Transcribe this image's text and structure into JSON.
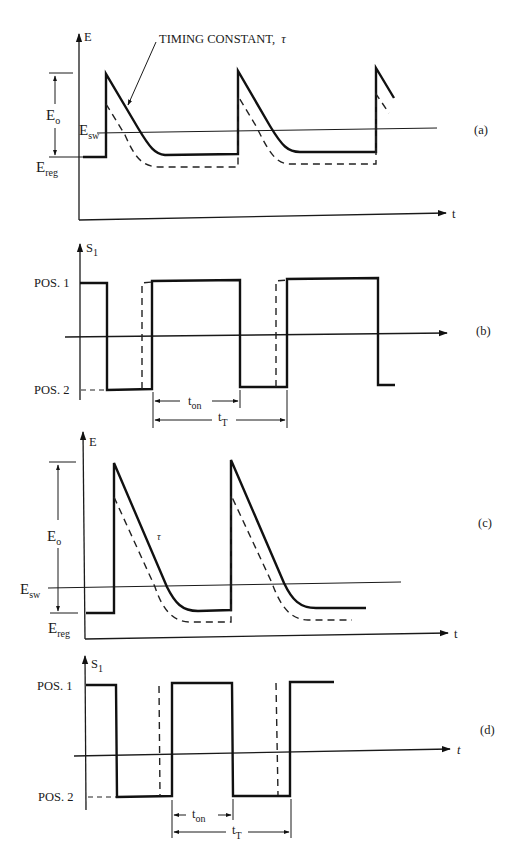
{
  "figure": {
    "panels": [
      {
        "id": "a",
        "label": "(a)",
        "y_axis_label": "E",
        "x_axis_label": "t",
        "levels": {
          "eo_label": "E",
          "eo_sub": "o",
          "esw_label": "E",
          "esw_sub": "sw",
          "ereg_label": "E",
          "ereg_sub": "reg"
        },
        "annotation": "TIMING CONSTANT,",
        "annotation_symbol": "τ"
      },
      {
        "id": "b",
        "label": "(b)",
        "y_axis_label": "S",
        "y_axis_sub": "1",
        "pos1_label": "POS. 1",
        "pos2_label": "POS. 2",
        "ton_label": "t",
        "ton_sub": "on",
        "tt_label": "t",
        "tt_sub": "T"
      },
      {
        "id": "c",
        "label": "(c)",
        "y_axis_label": "E",
        "x_axis_label": "t",
        "levels": {
          "eo_label": "E",
          "eo_sub": "o",
          "esw_label": "E",
          "esw_sub": "sw",
          "ereg_label": "E",
          "ereg_sub": "reg"
        },
        "tau_symbol": "τ"
      },
      {
        "id": "d",
        "label": "(d)",
        "y_axis_label": "S",
        "y_axis_sub": "1",
        "x_axis_label": "t",
        "pos1_label": "POS. 1",
        "pos2_label": "POS. 2",
        "ton_label": "t",
        "ton_sub": "on",
        "tt_label": "t",
        "tt_sub": "T"
      }
    ]
  },
  "colors": {
    "ink": "#111111",
    "background": "#ffffff"
  }
}
